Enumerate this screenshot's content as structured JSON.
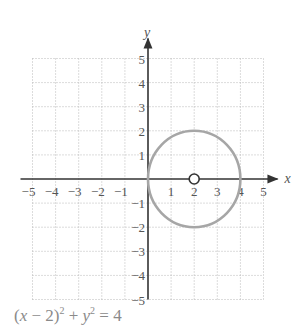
{
  "chart_data": {
    "type": "line",
    "title": "",
    "caption": "(x − 2)^2 + y^2 = 4",
    "xlabel": "x",
    "ylabel": "y",
    "xlim": [
      -5,
      5
    ],
    "ylim": [
      -5,
      5
    ],
    "grid": true,
    "grid_style": "dotted",
    "x_ticks": [
      -5,
      -4,
      -3,
      -2,
      -1,
      1,
      2,
      3,
      4,
      5
    ],
    "x_tick_labels": [
      "−5",
      "−4",
      "−3",
      "−2",
      "−1",
      "1",
      "2",
      "3",
      "4",
      "5"
    ],
    "y_ticks": [
      -5,
      -4,
      -3,
      -2,
      -1,
      1,
      2,
      3,
      4,
      5
    ],
    "y_tick_labels": [
      "−5",
      "−4",
      "−3",
      "−2",
      "−1",
      "1",
      "2",
      "3",
      "4",
      "5"
    ],
    "series": [
      {
        "name": "circle",
        "shape": "circle",
        "center": [
          2,
          0
        ],
        "radius": 2,
        "color": "#a6a6a6"
      }
    ],
    "annotations": [
      {
        "type": "open-point",
        "x": 2,
        "y": 0,
        "label": "center (2, 0)"
      }
    ],
    "colors": {
      "axis": "#333333",
      "grid": "#b8b8b8",
      "curve": "#a6a6a6",
      "text": "#555555",
      "caption": "#8a8a8a"
    }
  },
  "caption": {
    "lhs_open": "(",
    "x": "x",
    "minus_two": " − 2)",
    "sq1": "2",
    "plus": " + ",
    "y": "y",
    "sq2": "2",
    "rhs": " = 4"
  }
}
